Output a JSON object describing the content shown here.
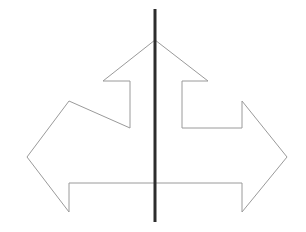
{
  "canvas": {
    "width": 306,
    "height": 232,
    "background_color": "#ffffff"
  },
  "figure": {
    "title": "Three-way arrow outline with vertical axis line",
    "kind": "line-drawing"
  },
  "shapes": {
    "arrow_outline": {
      "name": "three-way-arrow",
      "stroke_color": "#9a9a9a",
      "stroke_width": 1,
      "fill": "none",
      "points": "155,40 208,81 182,81 182,101 242,101 242,70 287,157 242,212 242,183 182,183 182,203 130,203 130,183 69,183 69,212 27,157 69,101 69,101 130,101 130,81 103,81",
      "vertices": [
        {
          "name": "up-apex",
          "x": 155,
          "y": 40
        },
        {
          "name": "up-right-barb-tip",
          "x": 208,
          "y": 81
        },
        {
          "name": "up-right-shaft-top",
          "x": 182,
          "y": 81
        },
        {
          "name": "up-right-shaft-bottom",
          "x": 182,
          "y": 128
        },
        {
          "name": "right-arm-top-inner",
          "x": 242,
          "y": 128
        },
        {
          "name": "right-barb-top-corner",
          "x": 242,
          "y": 101
        },
        {
          "name": "right-tip",
          "x": 287,
          "y": 157
        },
        {
          "name": "right-barb-bottom-corner",
          "x": 242,
          "y": 212
        },
        {
          "name": "right-arm-bottom-inner",
          "x": 242,
          "y": 183
        },
        {
          "name": "body-bottom-right",
          "x": 69,
          "y": 183
        },
        {
          "name": "left-barb-bottom-corner",
          "x": 69,
          "y": 212
        },
        {
          "name": "left-tip",
          "x": 27,
          "y": 157
        },
        {
          "name": "left-barb-top-corner",
          "x": 69,
          "y": 101
        },
        {
          "name": "left-arm-top-inner",
          "x": 130,
          "y": 128
        },
        {
          "name": "up-left-shaft-bottom",
          "x": 130,
          "y": 128
        },
        {
          "name": "up-left-shaft-top",
          "x": 130,
          "y": 81
        },
        {
          "name": "up-left-barb-tip",
          "x": 103,
          "y": 81
        }
      ]
    },
    "vertical_line": {
      "name": "vertical-axis-line",
      "stroke_color": "#2d2d2d",
      "stroke_width": 3,
      "x": 155,
      "y_top": 9,
      "y_bottom": 222
    }
  }
}
